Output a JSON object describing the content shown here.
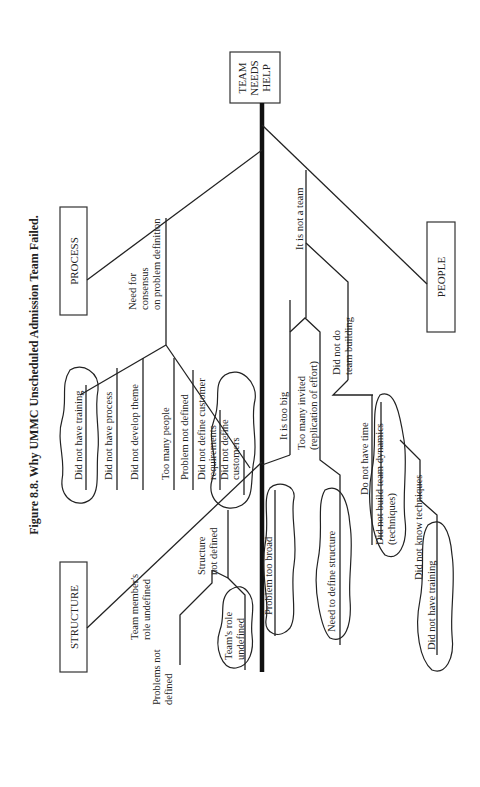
{
  "title": "Figure 8.8.  Why UMMC Unscheduled Admission Team Failed.",
  "head": {
    "lines": [
      "TEAM",
      "NEEDS",
      "HELP"
    ]
  },
  "categories": {
    "process": "PROCESS",
    "structure": "STRUCTURE",
    "people": "PEOPLE"
  },
  "process_causes": {
    "need_consensus": [
      "Need for",
      "consensus",
      "on problem definition"
    ],
    "training": "Did not have training",
    "process": "Did not have process",
    "theme": "Did not develop theme",
    "too_many": "Too many people",
    "problem_nd": "Problem not defined",
    "cust_req": [
      "Did not define customer",
      "requirements"
    ],
    "customers": [
      "Did not define",
      "customers"
    ]
  },
  "structure_causes": {
    "problems_nd": [
      "Problems not",
      "defined"
    ],
    "member_role": [
      "Team member's",
      "role undefined"
    ],
    "structure_nd": [
      "Structure",
      "not defined"
    ],
    "team_role": [
      "Team's role",
      "undefined"
    ],
    "too_broad": "Problem too broad"
  },
  "people_causes": {
    "too_big": "It is too big",
    "too_many_invited": [
      "Too many invited",
      "(replication of effort)"
    ],
    "define_structure": "Need to define structure",
    "not_team": "It is not a team",
    "team_building": [
      "Did not do",
      "team building"
    ],
    "no_time": "Do not have time",
    "dynamics": [
      "Did not build team dynamics",
      "(techniques)"
    ],
    "techniques": "Did not know techniques",
    "training2": "Did not have training"
  }
}
